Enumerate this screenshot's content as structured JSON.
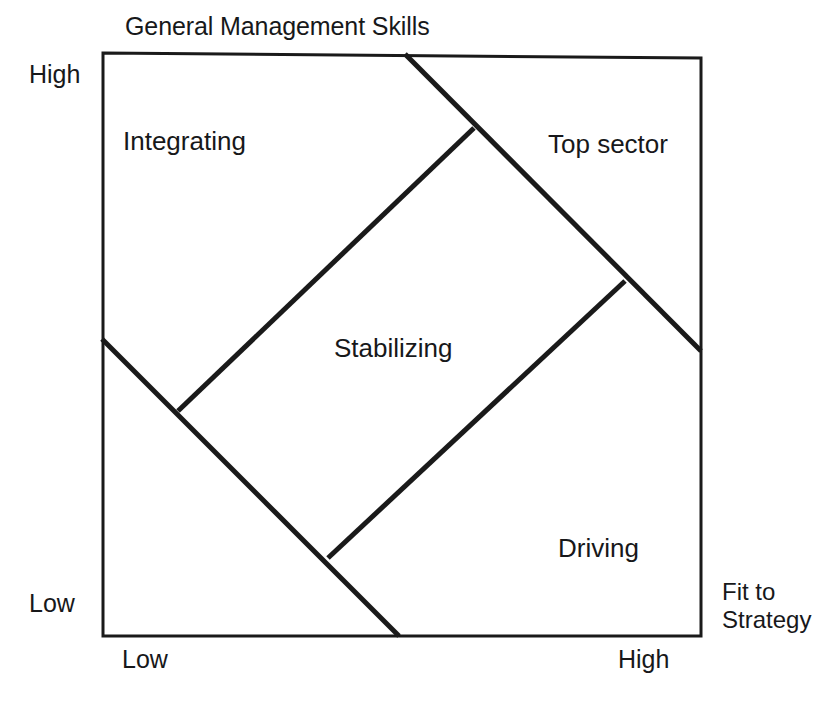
{
  "diagram": {
    "title": "General Management Skills",
    "axes": {
      "y_axis_title": "General Management Skills",
      "y_high_label": "High",
      "y_low_label": "Low",
      "x_axis_title_line1": "Fit to",
      "x_axis_title_line2": "Strategy",
      "x_low_label": "Low",
      "x_high_label": "High"
    },
    "regions": [
      {
        "key": "integrating",
        "label": "Integrating"
      },
      {
        "key": "top_sector",
        "label": "Top sector"
      },
      {
        "key": "stabilizing",
        "label": "Stabilizing"
      },
      {
        "key": "driving",
        "label": "Driving"
      }
    ],
    "colors": {
      "line": "#1a1a1a",
      "background": "#ffffff",
      "text": "#17181a"
    },
    "geometry": {
      "frame": {
        "x1": 103,
        "y1": 53,
        "x2": 701,
        "y2": 636
      },
      "diagonal_top_left_to_bottom_right": {
        "x1": 405,
        "y1": 54,
        "x2": 701,
        "y2": 351
      },
      "diagonal_left_to_bottom": {
        "x1": 102,
        "y1": 339,
        "x2": 399,
        "y2": 636
      },
      "diamond_edge_upper": {
        "x1": 178,
        "y1": 411,
        "x2": 474,
        "y2": 128
      },
      "diamond_edge_lower": {
        "x1": 328,
        "y1": 558,
        "x2": 625,
        "y2": 281
      }
    }
  }
}
